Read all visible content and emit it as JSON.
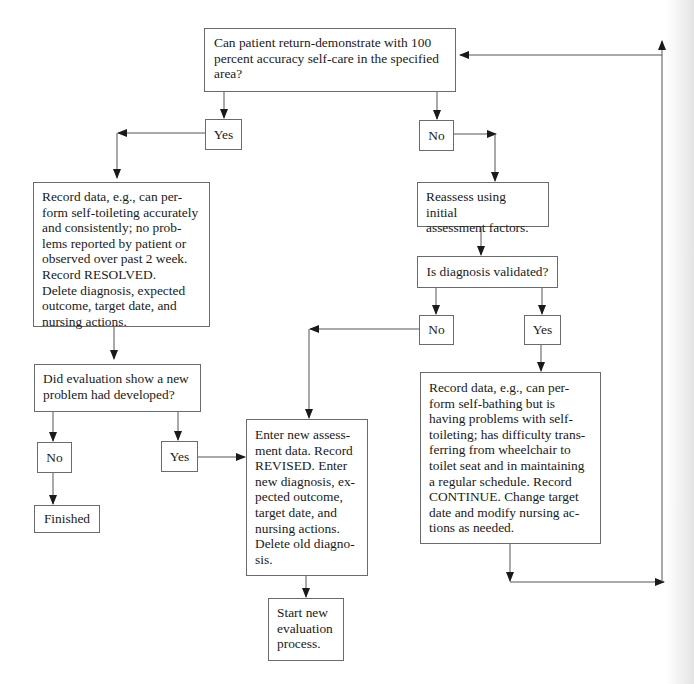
{
  "diagram": {
    "type": "flowchart",
    "nodes": {
      "start_question": "Can patient return-demonstrate with 100 percent accuracy self-care in the specified area?",
      "yes_1": "Yes",
      "no_1": "No",
      "resolved": "Record data, e.g., can perform self-toileting accurately and consistently; no problems reported by patient or observed over past 2 week. Record RESOLVED. Delete diagnosis, expected outcome, target date, and nursing actions.",
      "new_problem_question": "Did evaluation show a new problem had developed?",
      "no_2": "No",
      "yes_2": "Yes",
      "finished": "Finished",
      "reassess": "Reassess using initial assessment factors.",
      "diagnosis_question": "Is diagnosis validated?",
      "no_3": "No",
      "yes_3": "Yes",
      "revised": "Enter new assessment data. Record REVISED. Enter new diagnosis, expected outcome, target date, and nursing actions. Delete old diagnosis.",
      "start_new": "Start new evaluation process.",
      "continue": "Record data, e.g., can perform self-bathing but is having problems with self-toileting; has difficulty transferring from wheelchair to toilet seat and in maintaining a regular schedule. Record CONTINUE. Change target date and modify nursing actions as needed."
    },
    "text_lines": {
      "start_question": [
        "Can patient return-demonstrate with 100",
        "percent accuracy self-care in the specified",
        "area?"
      ],
      "resolved": [
        "Record data, e.g., can per-",
        "form self-toileting accurately",
        "and consistently; no prob-",
        "lems reported by patient or",
        "observed over past 2 week.",
        "Record RESOLVED.",
        "Delete diagnosis, expected",
        "outcome, target date, and",
        "nursing actions."
      ],
      "new_problem_question": [
        "Did evaluation show a new",
        "problem had developed?"
      ],
      "reassess": [
        "Reassess using initial",
        "assessment factors."
      ],
      "revised": [
        "Enter new assess-",
        "ment data. Record",
        "REVISED. Enter",
        "new diagnosis, ex-",
        "pected outcome,",
        "target date, and",
        "nursing actions.",
        "Delete old diagno-",
        "sis."
      ],
      "start_new": [
        "Start new",
        "evaluation",
        "process."
      ],
      "continue": [
        "Record data, e.g., can per-",
        "form self-bathing but is",
        "having problems with self-",
        "toileting; has difficulty trans-",
        "ferring from wheelchair to",
        "toilet seat and in maintaining",
        "a regular schedule. Record",
        "CONTINUE. Change target",
        "date and modify nursing ac-",
        "tions as needed."
      ]
    },
    "edges": [
      {
        "from": "start_question",
        "to": "yes_1"
      },
      {
        "from": "start_question",
        "to": "no_1"
      },
      {
        "from": "yes_1",
        "to": "resolved"
      },
      {
        "from": "resolved",
        "to": "new_problem_question"
      },
      {
        "from": "new_problem_question",
        "to": "no_2"
      },
      {
        "from": "new_problem_question",
        "to": "yes_2"
      },
      {
        "from": "no_2",
        "to": "finished"
      },
      {
        "from": "yes_2",
        "to": "revised"
      },
      {
        "from": "no_1",
        "to": "reassess"
      },
      {
        "from": "reassess",
        "to": "diagnosis_question"
      },
      {
        "from": "diagnosis_question",
        "to": "no_3"
      },
      {
        "from": "diagnosis_question",
        "to": "yes_3"
      },
      {
        "from": "no_3",
        "to": "revised"
      },
      {
        "from": "yes_3",
        "to": "continue"
      },
      {
        "from": "revised",
        "to": "start_new"
      },
      {
        "from": "continue",
        "to": "start_question",
        "label": "loop back"
      }
    ],
    "colors": {
      "line": "#555555",
      "border": "#6b6b6b",
      "text": "#1a1a1a",
      "background": "#ffffff"
    }
  }
}
